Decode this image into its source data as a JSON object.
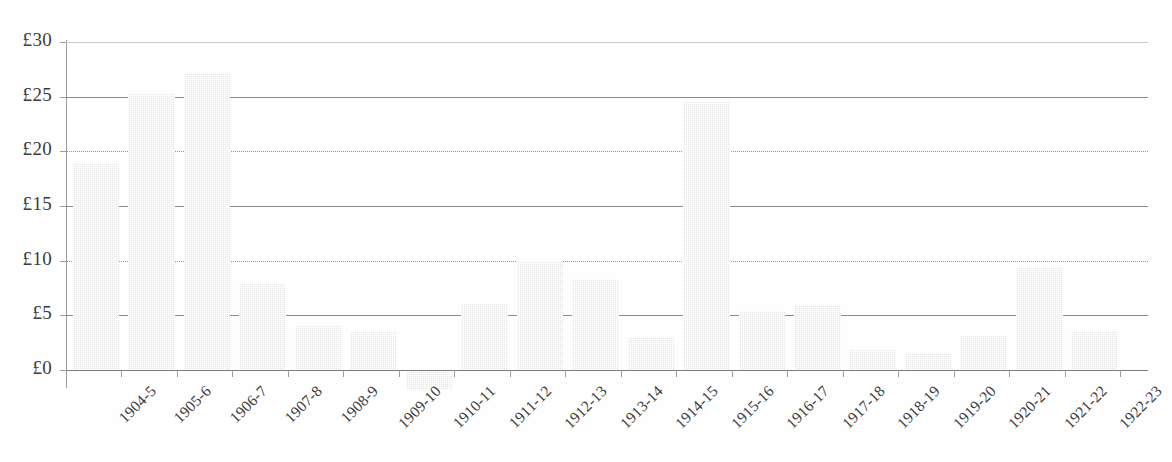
{
  "chart_data": {
    "type": "bar",
    "title": "",
    "subtitle": "",
    "xlabel": "",
    "ylabel": "",
    "categories": [
      "1904-5",
      "1905-6",
      "1906-7",
      "1907-8",
      "1908-9",
      "1909-10",
      "1910-11",
      "1911-12",
      "1912-13",
      "1913-14",
      "1914-15",
      "1915-16",
      "1916-17",
      "1917-18",
      "1918-19",
      "1919-20",
      "1920-21",
      "1921-22",
      "1922-23"
    ],
    "values": [
      18.9,
      25.2,
      27.2,
      7.9,
      4.0,
      3.6,
      -1.8,
      6.0,
      10.0,
      8.3,
      3.0,
      24.6,
      5.4,
      5.9,
      1.8,
      1.5,
      3.1,
      9.3,
      3.6
    ],
    "ylim": [
      0,
      30
    ],
    "y_ticks": [
      0,
      5,
      10,
      15,
      20,
      25,
      30
    ],
    "y_tick_labels": [
      "£0",
      "£5",
      "£10",
      "£15",
      "£20",
      "£25",
      "£30"
    ],
    "y_gridline_styles": [
      "solid",
      "solid",
      "dotted",
      "solid",
      "dotted",
      "solid",
      "faint"
    ],
    "currency_symbol": "£",
    "grid": true,
    "legend": false,
    "legend_position": "none",
    "bar_fill_color": "#e6e6e6",
    "axis_color": "#8e8e8e",
    "text_color": "#3c3c3c",
    "x_label_rotation_degrees": -45
  }
}
